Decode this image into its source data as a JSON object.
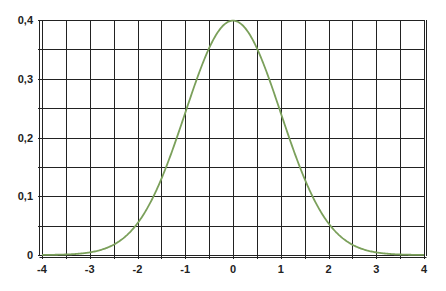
{
  "chart_data": {
    "type": "line",
    "title": "",
    "xlabel": "",
    "ylabel": "",
    "xlim": [
      -4,
      4
    ],
    "ylim": [
      0,
      0.4
    ],
    "x_ticks": [
      "-4",
      "-3",
      "-2",
      "-1",
      "0",
      "1",
      "2",
      "3",
      "4"
    ],
    "y_ticks": [
      "0",
      "0,1",
      "0,2",
      "0,3",
      "0,4"
    ],
    "grid": true,
    "grid_minor_x": 0.5,
    "grid_minor_y": 0.05,
    "legend": null,
    "series": [
      {
        "name": "Standard normal density",
        "color": "#7ba05b",
        "x": [
          -4,
          -3.5,
          -3,
          -2.5,
          -2,
          -1.5,
          -1,
          -0.5,
          0,
          0.5,
          1,
          1.5,
          2,
          2.5,
          3,
          3.5,
          4
        ],
        "values": [
          0.0001,
          0.0009,
          0.0044,
          0.0175,
          0.054,
          0.1295,
          0.242,
          0.3521,
          0.3989,
          0.3521,
          0.242,
          0.1295,
          0.054,
          0.0175,
          0.0044,
          0.0009,
          0.0001
        ]
      }
    ]
  },
  "colors": {
    "grid": "#222222",
    "curve": "#7ba05b",
    "background": "#ffffff"
  }
}
